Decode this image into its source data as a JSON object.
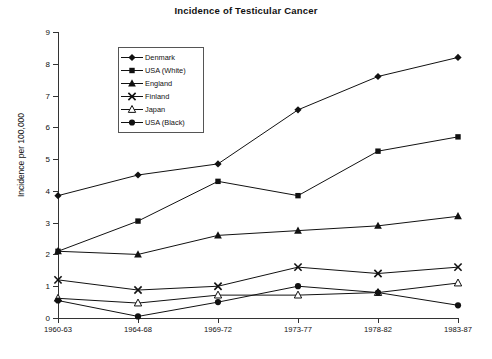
{
  "chart_data": {
    "type": "line",
    "title": "Incidence of Testicular Cancer",
    "xlabel": "",
    "ylabel": "Incidence per 100,000",
    "categories": [
      "1960-63",
      "1964-68",
      "1969-72",
      "1973-77",
      "1978-82",
      "1983-87"
    ],
    "ylim": [
      0,
      9
    ],
    "yticks": [
      0,
      1,
      2,
      3,
      4,
      5,
      6,
      7,
      8,
      9
    ],
    "grid": false,
    "legend_position": "upper-left-inside",
    "series": [
      {
        "name": "Denmark",
        "marker": "diamond",
        "values": [
          3.85,
          4.5,
          4.85,
          6.55,
          7.6,
          8.2
        ]
      },
      {
        "name": "USA (White)",
        "marker": "square",
        "values": [
          2.1,
          3.05,
          4.3,
          3.85,
          5.25,
          5.7
        ]
      },
      {
        "name": "England",
        "marker": "triangle",
        "values": [
          2.1,
          2.0,
          2.6,
          2.75,
          2.9,
          3.2
        ]
      },
      {
        "name": "Finland",
        "marker": "x",
        "values": [
          1.2,
          0.88,
          1.0,
          1.6,
          1.4,
          1.6
        ]
      },
      {
        "name": "Japan",
        "marker": "triangle-open",
        "values": [
          0.62,
          0.47,
          0.72,
          0.72,
          0.8,
          1.1
        ]
      },
      {
        "name": "USA (Black)",
        "marker": "circle",
        "values": [
          0.55,
          0.05,
          0.5,
          1.0,
          0.8,
          0.4
        ]
      }
    ],
    "colors": {
      "line": "#111111",
      "marker": "#111111",
      "axis": "#333333"
    }
  }
}
